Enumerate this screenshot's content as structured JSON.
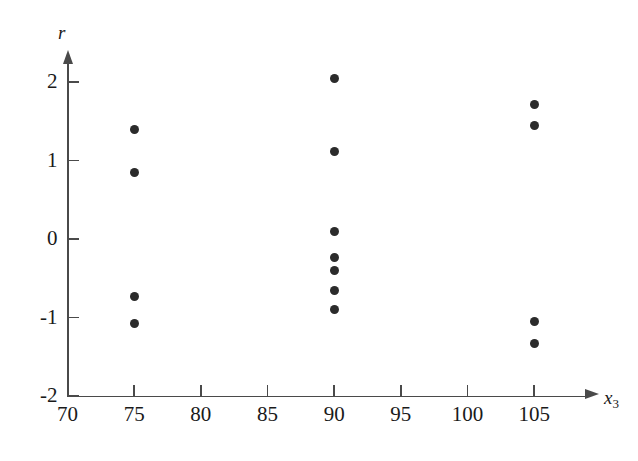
{
  "chart_data": {
    "type": "scatter",
    "title": "",
    "xlabel": "x3",
    "ylabel": "r",
    "xlabel_display": "x",
    "xlabel_subscript": "3",
    "ylabel_display": "r",
    "xlim": [
      70,
      107
    ],
    "ylim": [
      -2,
      2
    ],
    "xticks": [
      70,
      75,
      80,
      85,
      90,
      95,
      100,
      105
    ],
    "xticklabels": [
      "70",
      "75",
      "80",
      "85",
      "90",
      "95",
      "100",
      "105"
    ],
    "yticks": [
      2,
      1,
      0,
      -1,
      -2
    ],
    "yticklabels": [
      "2",
      "1",
      "0",
      "-1",
      "-2"
    ],
    "grid": false,
    "legend": false,
    "marker": "filled-circle",
    "marker_color": "#2b2b2b",
    "axis_color": "#4a4a4a",
    "background_color": "#ffffff",
    "points": [
      {
        "x": 75,
        "y": 1.39
      },
      {
        "x": 75,
        "y": 0.85
      },
      {
        "x": 75,
        "y": -0.73
      },
      {
        "x": 75,
        "y": -1.08
      },
      {
        "x": 90,
        "y": 2.04
      },
      {
        "x": 90,
        "y": 1.12
      },
      {
        "x": 90,
        "y": 0.09
      },
      {
        "x": 90,
        "y": -0.24
      },
      {
        "x": 90,
        "y": -0.4
      },
      {
        "x": 90,
        "y": -0.66
      },
      {
        "x": 90,
        "y": -0.9
      },
      {
        "x": 105,
        "y": 1.71
      },
      {
        "x": 105,
        "y": 1.44
      },
      {
        "x": 105,
        "y": -1.05
      },
      {
        "x": 105,
        "y": -1.33
      }
    ],
    "point_count": 15
  }
}
